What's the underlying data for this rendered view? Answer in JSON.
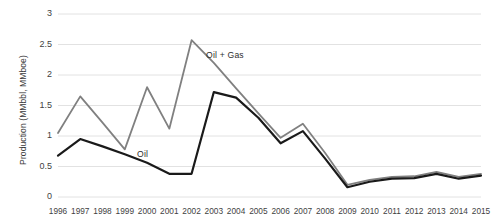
{
  "chart_data": {
    "type": "line",
    "title": "",
    "subtitle": "",
    "xlabel": "",
    "ylabel": "Production (MMbbl, MMboe)",
    "x": [
      1996,
      1997,
      1998,
      1999,
      2000,
      2001,
      2002,
      2003,
      2004,
      2005,
      2006,
      2007,
      2008,
      2009,
      2010,
      2011,
      2012,
      2013,
      2014,
      2015
    ],
    "categories": [
      "1996",
      "1997",
      "1998",
      "1999",
      "2000",
      "2001",
      "2002",
      "2003",
      "2004",
      "2005",
      "2006",
      "2007",
      "2008",
      "2009",
      "2010",
      "2011",
      "2012",
      "2013",
      "2014",
      "2015"
    ],
    "ylim": [
      0,
      3
    ],
    "yticks": [
      0,
      0.5,
      1,
      1.5,
      2,
      2.5,
      3
    ],
    "ytick_labels": [
      "0",
      "0.5",
      "1",
      "1.5",
      "2",
      "2.5",
      "3"
    ],
    "grid": true,
    "grid_axis": "y",
    "legend": "inline-annotations",
    "series": [
      {
        "name": "Oil + Gas",
        "color": "#808080",
        "values": [
          1.05,
          1.65,
          1.22,
          0.78,
          1.8,
          1.12,
          2.57,
          2.2,
          1.78,
          1.37,
          0.97,
          1.2,
          0.72,
          0.2,
          0.28,
          0.33,
          0.34,
          0.41,
          0.33,
          0.38
        ]
      },
      {
        "name": "Oil",
        "color": "#1a1a1a",
        "values": [
          0.68,
          0.95,
          0.83,
          0.7,
          0.56,
          0.38,
          0.38,
          1.72,
          1.63,
          1.3,
          0.88,
          1.08,
          0.63,
          0.16,
          0.25,
          0.3,
          0.31,
          0.38,
          0.3,
          0.35
        ]
      }
    ],
    "annotations": [
      {
        "text": "Oil + Gas",
        "series": "Oil + Gas"
      },
      {
        "text": "Oil",
        "series": "Oil"
      }
    ]
  },
  "axes": {
    "y_axis_title": "Production (MMbbl, MMboe)"
  }
}
